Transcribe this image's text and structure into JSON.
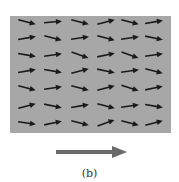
{
  "figure": {
    "caption": "(b)",
    "field_color": "#a7a7a7",
    "arrow_color": "#1a1a1a",
    "big_arrow_color": "#6b6b6b",
    "grid": {
      "rows": 7,
      "cols": 6,
      "col_x": [
        27,
        53,
        80,
        106,
        130,
        154
      ],
      "row_y": [
        22,
        38,
        55,
        71,
        88,
        106,
        123
      ],
      "angles_deg": [
        [
          15,
          -5,
          15,
          -15,
          15,
          -10
        ],
        [
          -10,
          15,
          -8,
          15,
          -8,
          12
        ],
        [
          10,
          -8,
          20,
          -12,
          20,
          -8
        ],
        [
          -10,
          10,
          -15,
          12,
          -8,
          15
        ],
        [
          15,
          -8,
          15,
          -15,
          18,
          -12
        ],
        [
          -15,
          12,
          -10,
          15,
          -8,
          10
        ],
        [
          8,
          -12,
          15,
          -20,
          15,
          -15
        ]
      ]
    },
    "big_arrow": {
      "direction": "right",
      "x1": 56,
      "x2": 125,
      "y": 151
    }
  }
}
